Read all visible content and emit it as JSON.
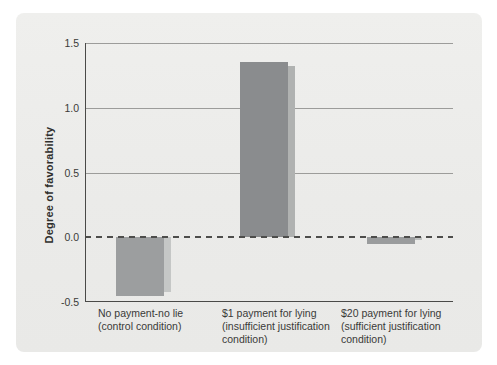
{
  "panel": {
    "background": "#ebebe9"
  },
  "chart_data": {
    "type": "bar",
    "title": "",
    "xlabel": "",
    "ylabel": "Degree of favorability",
    "categories": [
      "No payment-no lie\n(control condition)",
      "$1 payment for lying\n(insufficient justification\ncondition)",
      "$20 payment for lying\n(sufficient justification\ncondition)"
    ],
    "values": [
      -0.45,
      1.35,
      -0.05
    ],
    "ylim": [
      -0.5,
      1.5
    ],
    "yticks": [
      1.5,
      1.0,
      0.5,
      0.0,
      -0.5
    ],
    "ytick_labels": [
      "1.5",
      "1.0",
      "0.5",
      "0.0",
      "-0.5"
    ],
    "zero_baseline_style": "dashed",
    "grid": "horizontal",
    "legend": "none",
    "colors": {
      "bar_fills": [
        "#9c9e9f",
        "#8a8c8e",
        "#9a9c9d"
      ],
      "bar_shadows": [
        "#c5c7c6",
        "#b0b2b1",
        "#c0c2c1"
      ],
      "gridline": "#9c9c9a",
      "axis": "#4a4a48",
      "zero_line": "#4d4d4b",
      "text": "#3a3a38"
    }
  }
}
